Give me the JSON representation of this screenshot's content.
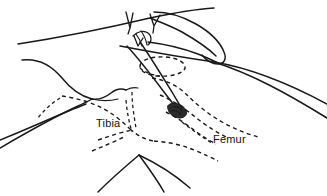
{
  "figure": {
    "kind": "anatomical-line-drawing",
    "background_color": "#ffffff",
    "ink_color": "#1a1a1a",
    "labels": [
      {
        "id": "tibia",
        "text": "Tibia",
        "x": 96,
        "y": 127
      },
      {
        "id": "femur",
        "text": "Femur",
        "x": 213,
        "y": 143
      }
    ],
    "legend": {
      "solid_line_meaning": "skin surface contour",
      "dashed_line_meaning": "underlying bone outline"
    }
  },
  "strokes": {
    "upper_thigh_contour": "M 18,44 C 70,36 116,26 150,18 C 178,12 198,9 214,8",
    "upper_thigh_lower_contour": "M 120,46 C 152,52 186,58 214,62 C 250,68 286,82 327,104",
    "leg_right_exit": "M 214,62 C 252,74 288,94 327,118",
    "examining_hand_back": "M 150,18 C 160,22 171,26 182,32 C 196,40 208,48 216,56",
    "index_finger_top": "M 154,12 C 166,12 182,16 196,24 C 210,32 220,42 224,52 C 227,59 224,64 218,64 C 212,64 206,60 202,55",
    "index_finger_bottom": "M 148,42 C 164,44 182,48 198,54 C 208,58 214,61 218,63",
    "finger_knuckle_curve": "M 133,36 C 138,31 144,30 148,33 C 152,36 152,42 148,45",
    "finger_crease_a": "M 136,34 C 139,38 141,42 142,46",
    "finger_crease_b": "M 141,31 C 144,35 146,40 147,45",
    "pressing_finger_upper": "M 127,46 C 138,58 152,76 164,92 C 170,100 175,106 178,110",
    "pressing_finger_lower": "M 140,42 C 150,56 162,76 172,92 C 176,99 180,105 182,109",
    "lower_hand_thumb_top": "M 22,60 C 38,58 52,66 62,78 C 70,88 80,96 92,99",
    "lower_hand_web": "M 92,99 C 100,100 106,97 111,93 C 116,89 121,88 126,90",
    "lower_hand_knuckle": "M 126,90 C 130,88 134,87 138,88",
    "lower_hand_index": "M 92,99 C 101,101 110,101 118,99",
    "lower_hand_lower_edge": "M 0,148 C 24,134 52,118 78,106 C 84,103 89,101 92,99",
    "calf_contour_left": "M 0,140 C 30,128 60,114 86,104",
    "shin_center": "M 139,155 C 147,166 156,178 164,192",
    "shin_left": "M 139,155 C 126,166 112,178 98,192",
    "shin_right": "M 139,155 C 156,163 174,174 190,188"
  },
  "dashed_outlines": {
    "patella_ellipse": "M 140,66 C 140,60 152,56 166,57 C 178,58 186,63 185,68 C 184,73 172,77 158,76 C 146,75 140,71 140,66",
    "patella_ellipse_tail": "M 140,68 C 144,72 152,75 160,76",
    "femoral_condyle_upper": "M 152,78 C 166,80 178,86 186,94 C 196,104 208,114 222,122 C 234,129 248,134 258,137",
    "femoral_condyle_mid": "M 160,95 C 172,100 184,108 194,116 C 206,126 218,133 228,138",
    "femoral_condyle_low": "M 166,112 C 176,117 186,124 194,130 C 202,136 210,141 216,144",
    "femur_shaft_dash": "M 182,122 C 192,130 202,137 212,143",
    "tibia_plateau_left": "M 62,96 C 76,98 90,102 102,108 C 112,113 122,121 130,129",
    "tibia_outline_mid": "M 130,129 C 138,136 146,140 154,141",
    "joint_line_right": "M 154,141 C 168,142 182,145 194,150 C 204,154 212,158 218,161",
    "tibia_shaft_left": "M 98,140 C 110,136 122,132 132,130",
    "tibia_shaft_lower": "M 92,151 C 104,146 116,141 126,136",
    "tibia_spine": "M 132,92 C 132,104 134,116 136,128",
    "tibia_spine_b": "M 126,100 C 127,112 129,122 132,132",
    "fibula_dash": "M 60,98 C 52,103 44,110 38,118"
  },
  "motion_marks": {
    "mark_left": "M 126,12 L 130,28 M 130,28 L 133,13 M 130,28 L 128,34",
    "mark_right": "M 150,14 L 154,26 M 154,26 L 160,15 M 154,26 L 153,33",
    "mark_small": "M 134,36 L 138,46 M 138,46 L 143,38"
  },
  "fingertip": {
    "nail_path": "M 170,104 C 176,102 183,105 186,110 C 188,114 185,118 180,118 C 174,118 169,114 168,109 C 167,106 168,105 170,104",
    "nail_detail_a": "M 172,107 C 176,106 180,108 182,111",
    "nail_detail_b": "M 171,111 C 175,110 179,112 181,115"
  }
}
